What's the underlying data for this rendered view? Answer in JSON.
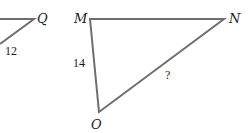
{
  "diagram": {
    "triangles": [
      {
        "name": "partial-left-triangle",
        "vertices": [
          {
            "label": "Q"
          }
        ],
        "sides": [
          {
            "label": "12"
          }
        ]
      },
      {
        "name": "MNO",
        "vertices": [
          {
            "label": "M"
          },
          {
            "label": "N"
          },
          {
            "label": "O"
          }
        ],
        "sides": [
          {
            "between": "MO",
            "label": "14"
          },
          {
            "between": "NO",
            "label": "?"
          }
        ]
      }
    ],
    "colors": {
      "stroke": "#6e6e6e",
      "text": "#1a1a1a",
      "background": "#ffffff"
    }
  }
}
